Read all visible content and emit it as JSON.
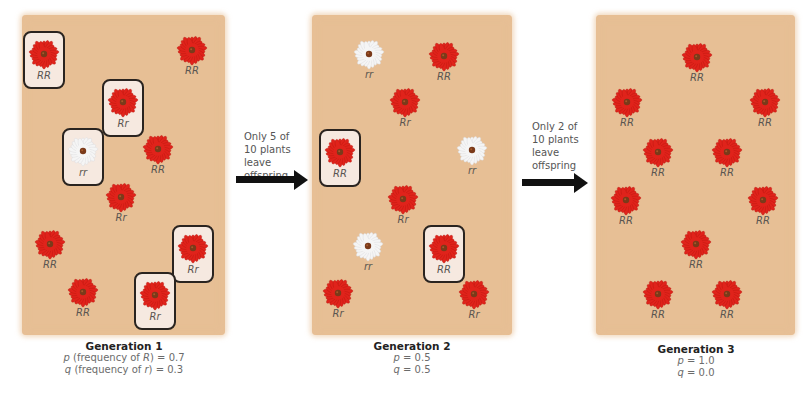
{
  "colors": {
    "panel_bg": "#e7bf95",
    "red_flower": "#e0231b",
    "white_flower": "#f5f5f5",
    "flower_center": "#7a3a1a",
    "box_border": "#2a2420",
    "box_fill": "#f6e9e0"
  },
  "generations": [
    {
      "title": "Generation 1",
      "p_line": {
        "sym": "p",
        "desc": " (frequency of ",
        "allele": "R",
        "end": ") = 0.7"
      },
      "q_line": {
        "sym": "q",
        "desc": " (frequency of ",
        "allele": "r",
        "end": ") = 0.3"
      },
      "plants": [
        {
          "genotype": "RR",
          "color": "red",
          "boxed": true,
          "x": 44,
          "y": 58
        },
        {
          "genotype": "RR",
          "color": "red",
          "boxed": false,
          "x": 192,
          "y": 56
        },
        {
          "genotype": "Rr",
          "color": "red",
          "boxed": true,
          "x": 123,
          "y": 106
        },
        {
          "genotype": "rr",
          "color": "white",
          "boxed": true,
          "x": 83,
          "y": 155
        },
        {
          "genotype": "RR",
          "color": "red",
          "boxed": false,
          "x": 158,
          "y": 155
        },
        {
          "genotype": "Rr",
          "color": "red",
          "boxed": false,
          "x": 121,
          "y": 203
        },
        {
          "genotype": "RR",
          "color": "red",
          "boxed": false,
          "x": 50,
          "y": 250
        },
        {
          "genotype": "Rr",
          "color": "red",
          "boxed": true,
          "x": 193,
          "y": 252
        },
        {
          "genotype": "RR",
          "color": "red",
          "boxed": false,
          "x": 83,
          "y": 298
        },
        {
          "genotype": "Rr",
          "color": "red",
          "boxed": true,
          "x": 155,
          "y": 299
        }
      ]
    },
    {
      "title": "Generation 2",
      "p_line": {
        "sym": "p",
        "desc": "",
        "allele": "",
        "end": " = 0.5"
      },
      "q_line": {
        "sym": "q",
        "desc": "",
        "allele": "",
        "end": " = 0.5"
      },
      "plants": [
        {
          "genotype": "rr",
          "color": "white",
          "boxed": false,
          "x": 369,
          "y": 60
        },
        {
          "genotype": "RR",
          "color": "red",
          "boxed": false,
          "x": 444,
          "y": 62
        },
        {
          "genotype": "Rr",
          "color": "red",
          "boxed": false,
          "x": 405,
          "y": 108
        },
        {
          "genotype": "RR",
          "color": "red",
          "boxed": true,
          "x": 340,
          "y": 156
        },
        {
          "genotype": "rr",
          "color": "white",
          "boxed": false,
          "x": 472,
          "y": 156
        },
        {
          "genotype": "Rr",
          "color": "red",
          "boxed": false,
          "x": 403,
          "y": 205
        },
        {
          "genotype": "rr",
          "color": "white",
          "boxed": false,
          "x": 368,
          "y": 252
        },
        {
          "genotype": "RR",
          "color": "red",
          "boxed": true,
          "x": 444,
          "y": 252
        },
        {
          "genotype": "Rr",
          "color": "red",
          "boxed": false,
          "x": 338,
          "y": 299
        },
        {
          "genotype": "Rr",
          "color": "red",
          "boxed": false,
          "x": 474,
          "y": 300
        }
      ]
    },
    {
      "title": "Generation 3",
      "p_line": {
        "sym": "p",
        "desc": "",
        "allele": "",
        "end": " = 1.0"
      },
      "q_line": {
        "sym": "q",
        "desc": "",
        "allele": "",
        "end": " = 0.0"
      },
      "plants": [
        {
          "genotype": "RR",
          "color": "red",
          "boxed": false,
          "x": 697,
          "y": 63
        },
        {
          "genotype": "RR",
          "color": "red",
          "boxed": false,
          "x": 627,
          "y": 108
        },
        {
          "genotype": "RR",
          "color": "red",
          "boxed": false,
          "x": 765,
          "y": 108
        },
        {
          "genotype": "RR",
          "color": "red",
          "boxed": false,
          "x": 658,
          "y": 158
        },
        {
          "genotype": "RR",
          "color": "red",
          "boxed": false,
          "x": 727,
          "y": 158
        },
        {
          "genotype": "RR",
          "color": "red",
          "boxed": false,
          "x": 626,
          "y": 206
        },
        {
          "genotype": "RR",
          "color": "red",
          "boxed": false,
          "x": 763,
          "y": 206
        },
        {
          "genotype": "RR",
          "color": "red",
          "boxed": false,
          "x": 696,
          "y": 250
        },
        {
          "genotype": "RR",
          "color": "red",
          "boxed": false,
          "x": 658,
          "y": 300
        },
        {
          "genotype": "RR",
          "color": "red",
          "boxed": false,
          "x": 727,
          "y": 300
        }
      ]
    }
  ],
  "transitions": [
    {
      "line1": "Only 5 of",
      "line2": "10 plants",
      "line3": "leave",
      "line4": "offspring"
    },
    {
      "line1": "Only 2 of",
      "line2": "10 plants",
      "line3": "leave",
      "line4": "offspring"
    }
  ]
}
